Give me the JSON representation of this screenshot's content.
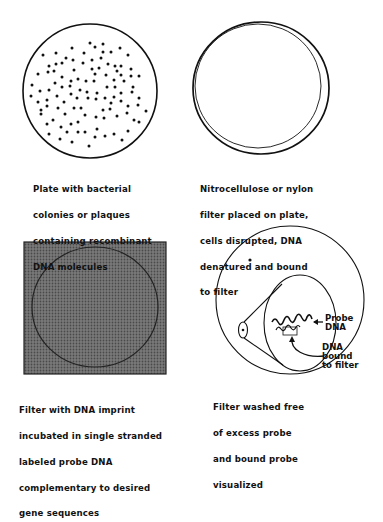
{
  "diagram": {
    "type": "process-steps",
    "panels": [
      {
        "id": "plate",
        "caption_lines": [
          "Plate with bacterial",
          "colonies or plaques",
          "containing recombinant",
          "DNA molecules"
        ]
      },
      {
        "id": "filter-placed",
        "caption_lines": [
          "Nitrocellulose or nylon",
          "filter placed on plate,",
          "cells disrupted, DNA",
          "denatured and bound",
          "to filter"
        ]
      },
      {
        "id": "probe-incubation",
        "caption_lines": [
          "Filter with DNA imprint",
          "incubated in single stranded",
          "labeled probe DNA",
          "complementary to desired",
          "gene sequences"
        ]
      },
      {
        "id": "visualized",
        "caption_lines": [
          "Filter washed free",
          "of excess probe",
          "and bound probe",
          "visualized"
        ],
        "labels": {
          "probe_dna": [
            "Probe",
            "DNA"
          ],
          "dna_bound": [
            "DNA",
            "bound",
            "to filter"
          ]
        }
      }
    ],
    "colors": {
      "ink": "#111111",
      "filter_fill": "#6e6e6e",
      "background": "#ffffff"
    }
  }
}
